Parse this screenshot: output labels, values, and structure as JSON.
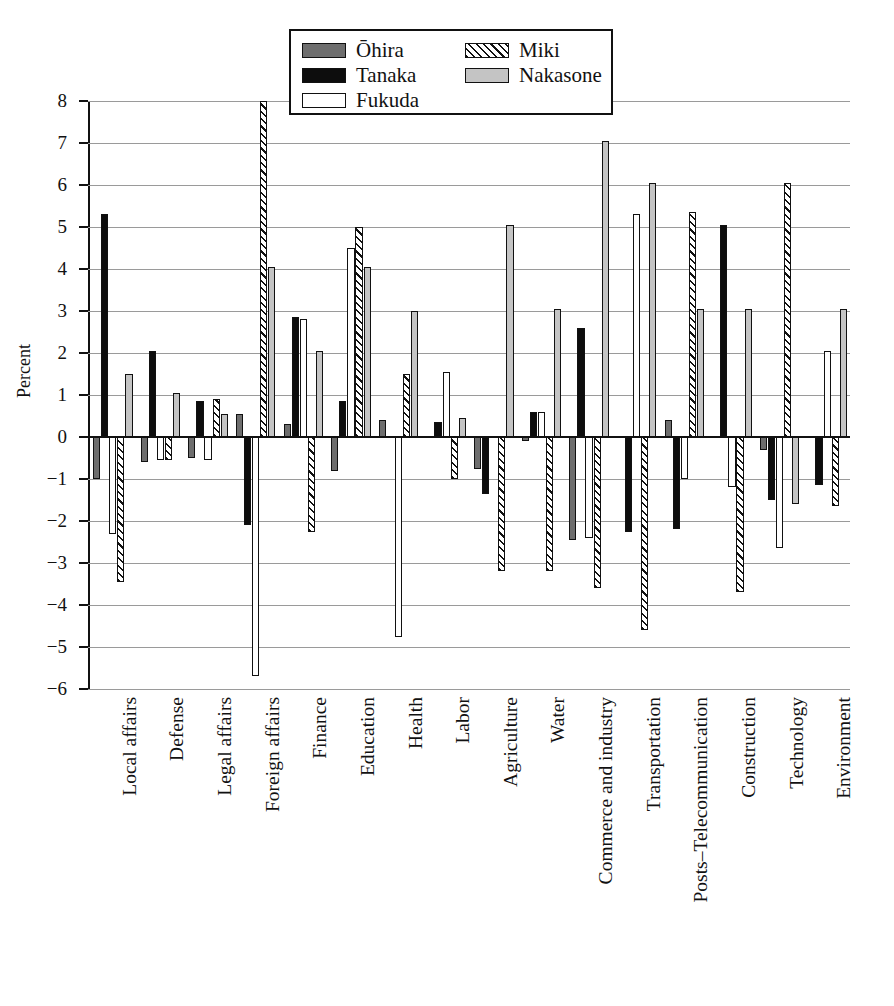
{
  "chart_data": {
    "type": "bar",
    "title": "",
    "subtitle": "",
    "xlabel": "",
    "ylabel": "Percent",
    "ylim": [
      -6,
      8
    ],
    "ytick_labels": [
      "8",
      "7",
      "6",
      "5",
      "4",
      "3",
      "2",
      "1",
      "0",
      "−1",
      "−2",
      "−3",
      "−4",
      "−5",
      "−6"
    ],
    "ytick_values": [
      8,
      7,
      6,
      5,
      4,
      3,
      2,
      1,
      0,
      -1,
      -2,
      -3,
      -4,
      -5,
      -6
    ],
    "grid": true,
    "legend_position": "top-center",
    "orientation": "vertical-grouped",
    "categories": [
      "Local affairs",
      "Defense",
      "Legal affairs",
      "Foreign affairs",
      "Finance",
      "Education",
      "Health",
      "Labor",
      "Agriculture",
      "Water",
      "Commerce and industry",
      "Transportation",
      "Posts–Telecommunication",
      "Construction",
      "Technology",
      "Environment"
    ],
    "series": [
      {
        "name": "Ōhira",
        "fill": "#6e6e6e",
        "pattern": "solid-dark-gray",
        "values": [
          -1.0,
          -0.6,
          -0.5,
          0.55,
          0.3,
          -0.8,
          0.4,
          null,
          -0.75,
          -0.1,
          -2.45,
          null,
          0.4,
          null,
          -0.3,
          null
        ]
      },
      {
        "name": "Tanaka",
        "fill": "#0d0d0d",
        "pattern": "solid-black",
        "values": [
          5.3,
          2.05,
          0.85,
          -2.1,
          2.85,
          0.85,
          null,
          0.35,
          -1.35,
          0.6,
          2.6,
          -2.25,
          -2.2,
          5.05,
          -1.5,
          -1.15
        ]
      },
      {
        "name": "Fukuda",
        "fill": "#ffffff",
        "pattern": "open-white",
        "values": [
          -2.3,
          -0.55,
          -0.55,
          -5.7,
          2.8,
          4.5,
          -4.75,
          1.55,
          null,
          0.6,
          -2.4,
          5.3,
          -1.0,
          -1.2,
          -2.65,
          2.05
        ]
      },
      {
        "name": "Miki",
        "fill": "#ffffff",
        "pattern": "diagonal-hatch",
        "values": [
          -3.45,
          -0.55,
          0.9,
          8.0,
          -2.25,
          5.0,
          1.5,
          -1.0,
          -3.2,
          -3.2,
          -3.6,
          -4.6,
          5.35,
          -3.7,
          6.05,
          -1.65
        ]
      },
      {
        "name": "Nakasone",
        "fill": "#c4c4c4",
        "pattern": "solid-light-gray",
        "values": [
          1.5,
          1.05,
          0.55,
          4.05,
          2.05,
          4.05,
          3.0,
          0.45,
          5.05,
          3.05,
          7.05,
          6.05,
          3.05,
          3.05,
          -1.6,
          3.05
        ]
      }
    ]
  },
  "legend": {
    "entries": [
      {
        "label": "Ōhira",
        "series_key": "ohira"
      },
      {
        "label": "Tanaka",
        "series_key": "tanaka"
      },
      {
        "label": "Fukuda",
        "series_key": "fukuda"
      },
      {
        "label": "Miki",
        "series_key": "miki"
      },
      {
        "label": "Nakasone",
        "series_key": "nakasone"
      }
    ]
  }
}
